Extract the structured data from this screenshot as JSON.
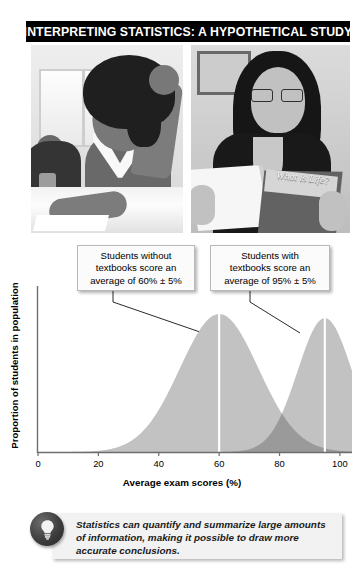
{
  "figure": {
    "title": "INTERPRETING STATISTICS: A HYPOTHETICAL STUDY"
  },
  "photos": [
    {
      "name": "photo-student-without-textbook",
      "alt": "Student writing at a desk without a textbook"
    },
    {
      "name": "photo-student-with-textbook",
      "alt": "Student reading a textbook",
      "book_title": "What is Life?"
    }
  ],
  "callouts": [
    {
      "id": "callout-without-textbooks",
      "text": "Students without textbooks score an average of 60% ± 5%",
      "lines": [
        "Students without",
        "textbooks score an",
        "average of 60% ± 5%"
      ],
      "mean": 60,
      "sd": 5
    },
    {
      "id": "callout-with-textbooks",
      "text": "Students with textbooks score an average of 95% ± 5%",
      "lines": [
        "Students with",
        "textbooks score an",
        "average of 95% ± 5%"
      ],
      "mean": 95,
      "sd": 5
    }
  ],
  "chart_data": {
    "type": "area",
    "title": "",
    "xlabel": "Average exam scores (%)",
    "ylabel": "Proportion of students in population",
    "xlim": [
      0,
      104
    ],
    "ylim": [
      0,
      1
    ],
    "xticks": [
      0,
      20,
      40,
      60,
      80,
      100
    ],
    "xtick_labels": [
      "0",
      "20",
      "40",
      "60",
      "80",
      "100"
    ],
    "yticks": [],
    "ytick_labels": [],
    "grid": false,
    "legend": false,
    "mean_marker_color": "#ffffff",
    "series": [
      {
        "name": "Students without textbooks",
        "distribution": "normal",
        "mean": 60,
        "sd": 13,
        "peak_value": 1.0,
        "color": "#c2c2c2",
        "mean_line": 60
      },
      {
        "name": "Students with textbooks",
        "distribution": "normal",
        "mean": 95,
        "sd": 9,
        "peak_value": 0.97,
        "color": "#c2c2c2",
        "overlap_color": "#9a9a9a",
        "mean_line": 95
      }
    ],
    "annotations": [
      {
        "text": "Students without textbooks score an average of 60% ± 5%",
        "points_to_x": 60
      },
      {
        "text": "Students with textbooks score an average of 95% ± 5%",
        "points_to_x": 95
      }
    ]
  },
  "tip": {
    "icon": "lightbulb-icon",
    "text": "Statistics can quantify and summarize large amounts of information, making it possible to draw more accurate conclusions."
  },
  "colors": {
    "banner_background": "#000000",
    "banner_text": "#ffffff",
    "curve_light": "#c2c2c2",
    "curve_overlap": "#9a9a9a",
    "axis": "#6e6e6e",
    "callout_background": "#fbfbfb",
    "tip_background": "#f2f2f2"
  }
}
